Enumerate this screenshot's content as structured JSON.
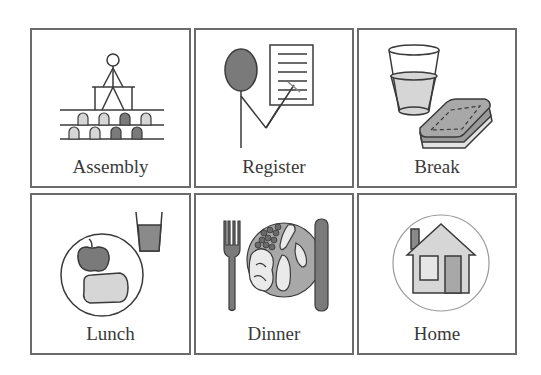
{
  "board": {
    "tiles": [
      {
        "label": "Assembly",
        "icon": "assembly-icon"
      },
      {
        "label": "Register",
        "icon": "register-icon"
      },
      {
        "label": "Break",
        "icon": "break-icon"
      },
      {
        "label": "Lunch",
        "icon": "lunch-icon"
      },
      {
        "label": "Dinner",
        "icon": "dinner-icon"
      },
      {
        "label": "Home",
        "icon": "home-icon"
      }
    ]
  },
  "colors": {
    "border": "#6b6b6b",
    "text": "#3a3a3a",
    "dark_fill": "#7a7a7a",
    "mid_fill": "#a8a8a8",
    "light_fill": "#d6d6d6"
  }
}
